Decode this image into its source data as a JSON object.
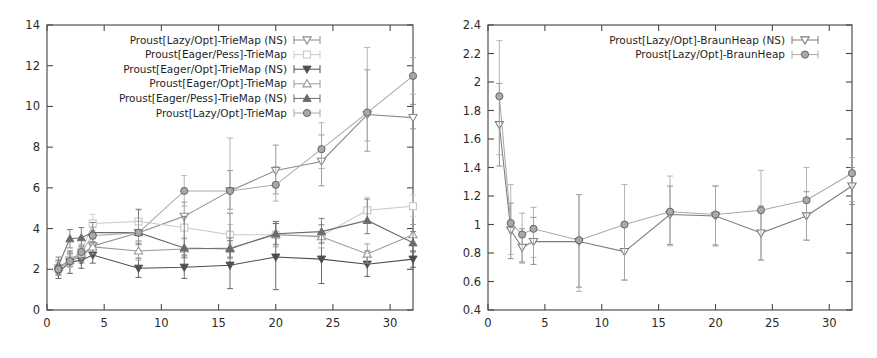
{
  "figure": {
    "name": "two-panel-benchmark-figure",
    "background": "#ffffff",
    "panels": 2
  },
  "colors": {
    "lazy_opt_ns": "#8a8a8a",
    "eager_pess": "#c9c9c9",
    "eager_opt_ns": "#4f4f4f",
    "eager_opt": "#9a9a9a",
    "eager_pess_ns": "#6b6b6b",
    "lazy_opt": "#a8a8a8",
    "braun_lazy_opt_ns": "#7d7d7d",
    "braun_lazy_opt": "#a9a9a9",
    "axis": "#4a4a4a",
    "text": "#1f1f1f"
  },
  "chart_data": [
    {
      "type": "line",
      "name": "triemap-panel",
      "title": "",
      "xlabel": "",
      "ylabel": "",
      "xlim": [
        0,
        32
      ],
      "ylim": [
        0,
        14
      ],
      "xticks": [
        0,
        5,
        10,
        15,
        20,
        25,
        30
      ],
      "xtick_labels": [
        "0",
        "5",
        "10",
        "15",
        "20",
        "25",
        "30"
      ],
      "yticks": [
        0,
        2,
        4,
        6,
        8,
        10,
        12,
        14
      ],
      "ytick_labels": [
        "0",
        "2",
        "4",
        "6",
        "8",
        "10",
        "12",
        "14"
      ],
      "grid": false,
      "legend_position": "top-center",
      "errorbars": true,
      "x": [
        1,
        2,
        3,
        4,
        8,
        12,
        16,
        20,
        24,
        28,
        32
      ],
      "series": [
        {
          "name": "Proust[Lazy/Opt]-TrieMap (NS)",
          "marker": "triangle-down-open",
          "color": "#8a8a8a",
          "values": [
            2.05,
            2.45,
            2.6,
            3.15,
            3.8,
            4.6,
            5.85,
            6.85,
            7.3,
            9.6,
            9.45
          ],
          "err_low": [
            1.7,
            2.15,
            2.3,
            2.8,
            3.2,
            3.95,
            4.95,
            5.7,
            6.1,
            7.8,
            8.9
          ],
          "err_high": [
            2.45,
            2.8,
            2.95,
            3.55,
            4.45,
            5.3,
            6.85,
            8.1,
            8.6,
            11.8,
            10.1
          ]
        },
        {
          "name": "Proust[Eager/Pess]-TrieMap",
          "marker": "square-open",
          "color": "#c9c9c9",
          "values": [
            2.05,
            2.4,
            2.85,
            4.25,
            4.35,
            4.05,
            3.7,
            3.7,
            3.65,
            4.9,
            5.1
          ],
          "err_low": [
            1.75,
            2.15,
            2.5,
            3.9,
            3.85,
            3.55,
            3.25,
            3.25,
            3.25,
            4.35,
            4.6
          ],
          "err_high": [
            2.4,
            2.7,
            3.25,
            4.7,
            4.9,
            4.6,
            4.2,
            4.25,
            4.15,
            5.55,
            5.65
          ]
        },
        {
          "name": "Proust[Eager/Opt]-TrieMap (NS)",
          "marker": "triangle-down-filled",
          "color": "#4f4f4f",
          "values": [
            1.85,
            2.35,
            2.45,
            2.7,
            2.05,
            2.1,
            2.2,
            2.6,
            2.5,
            2.25,
            2.5
          ],
          "err_low": [
            1.55,
            1.8,
            2.05,
            2.3,
            1.6,
            1.55,
            1.05,
            1.0,
            1.3,
            1.65,
            2.1
          ],
          "err_high": [
            2.15,
            2.9,
            2.85,
            3.15,
            2.55,
            2.7,
            3.4,
            4.25,
            3.75,
            2.9,
            2.9
          ]
        },
        {
          "name": "Proust[Eager/Opt]-TrieMap",
          "marker": "triangle-up-open",
          "color": "#9a9a9a",
          "values": [
            2.1,
            2.45,
            2.75,
            3.1,
            2.9,
            3.0,
            3.05,
            3.7,
            3.6,
            2.75,
            3.7
          ],
          "err_low": [
            1.8,
            2.15,
            2.35,
            2.75,
            2.45,
            2.55,
            2.6,
            3.1,
            3.05,
            2.3,
            3.2
          ],
          "err_high": [
            2.45,
            2.8,
            3.15,
            3.5,
            3.4,
            3.5,
            3.55,
            4.35,
            4.2,
            3.25,
            4.2
          ]
        },
        {
          "name": "Proust[Eager/Pess]-TrieMap (NS)",
          "marker": "triangle-up-filled",
          "color": "#6b6b6b",
          "values": [
            2.2,
            3.5,
            3.55,
            3.8,
            3.8,
            3.05,
            3.0,
            3.75,
            3.85,
            4.4,
            3.3
          ],
          "err_low": [
            1.85,
            3.05,
            3.1,
            3.35,
            3.25,
            2.6,
            2.55,
            3.2,
            3.3,
            3.75,
            2.85
          ],
          "err_high": [
            2.6,
            3.95,
            4.05,
            4.3,
            4.95,
            4.6,
            4.75,
            4.35,
            4.5,
            5.45,
            3.85
          ]
        },
        {
          "name": "Proust[Lazy/Opt]-TrieMap",
          "marker": "circle-filled",
          "color": "#a8a8a8",
          "values": [
            2.0,
            2.4,
            2.85,
            3.65,
            3.8,
            5.85,
            5.85,
            6.15,
            7.9,
            9.7,
            11.5
          ],
          "err_low": [
            1.7,
            2.1,
            2.5,
            3.25,
            3.35,
            5.1,
            4.75,
            5.35,
            6.95,
            8.3,
            10.6
          ],
          "err_high": [
            2.35,
            2.75,
            3.2,
            4.05,
            4.35,
            6.6,
            8.45,
            7.05,
            9.2,
            12.9,
            12.4
          ]
        }
      ]
    },
    {
      "type": "line",
      "name": "braunheap-panel",
      "title": "",
      "xlabel": "",
      "ylabel": "",
      "xlim": [
        0,
        32
      ],
      "ylim": [
        0.4,
        2.4
      ],
      "xticks": [
        0,
        5,
        10,
        15,
        20,
        25,
        30
      ],
      "xtick_labels": [
        "0",
        "5",
        "10",
        "15",
        "20",
        "25",
        "30"
      ],
      "yticks": [
        0.4,
        0.6,
        0.8,
        1.0,
        1.2,
        1.4,
        1.6,
        1.8,
        2.0,
        2.2,
        2.4
      ],
      "ytick_labels": [
        "0.4",
        "0.6",
        "0.8",
        "1",
        "1.2",
        "1.4",
        "1.6",
        "1.8",
        "2",
        "2.2",
        "2.4"
      ],
      "grid": false,
      "legend_position": "top-center",
      "errorbars": true,
      "x": [
        1,
        2,
        3,
        4,
        8,
        12,
        16,
        20,
        24,
        28,
        32
      ],
      "series": [
        {
          "name": "Proust[Lazy/Opt]-BraunHeap (NS)",
          "marker": "triangle-down-open",
          "color": "#7d7d7d",
          "values": [
            1.7,
            0.96,
            0.84,
            0.88,
            0.88,
            0.81,
            1.07,
            1.06,
            0.94,
            1.06,
            1.27
          ],
          "err_low": [
            1.41,
            0.76,
            0.73,
            0.72,
            0.56,
            0.61,
            0.86,
            0.85,
            0.75,
            0.89,
            1.14
          ],
          "err_high": [
            1.99,
            1.15,
            0.97,
            1.05,
            1.21,
            1.01,
            1.27,
            1.27,
            1.13,
            1.23,
            1.4
          ]
        },
        {
          "name": "Proust[Lazy/Opt]-BraunHeap",
          "marker": "circle-filled",
          "color": "#a9a9a9",
          "values": [
            1.9,
            1.01,
            0.93,
            0.97,
            0.89,
            1.0,
            1.09,
            1.07,
            1.1,
            1.17,
            1.36
          ],
          "err_low": [
            1.49,
            0.79,
            0.74,
            0.77,
            0.53,
            0.61,
            0.85,
            0.86,
            0.75,
            0.89,
            1.16
          ],
          "err_high": [
            2.29,
            1.28,
            1.08,
            1.12,
            1.21,
            1.28,
            1.34,
            1.27,
            1.38,
            1.4,
            1.47
          ]
        }
      ]
    }
  ]
}
